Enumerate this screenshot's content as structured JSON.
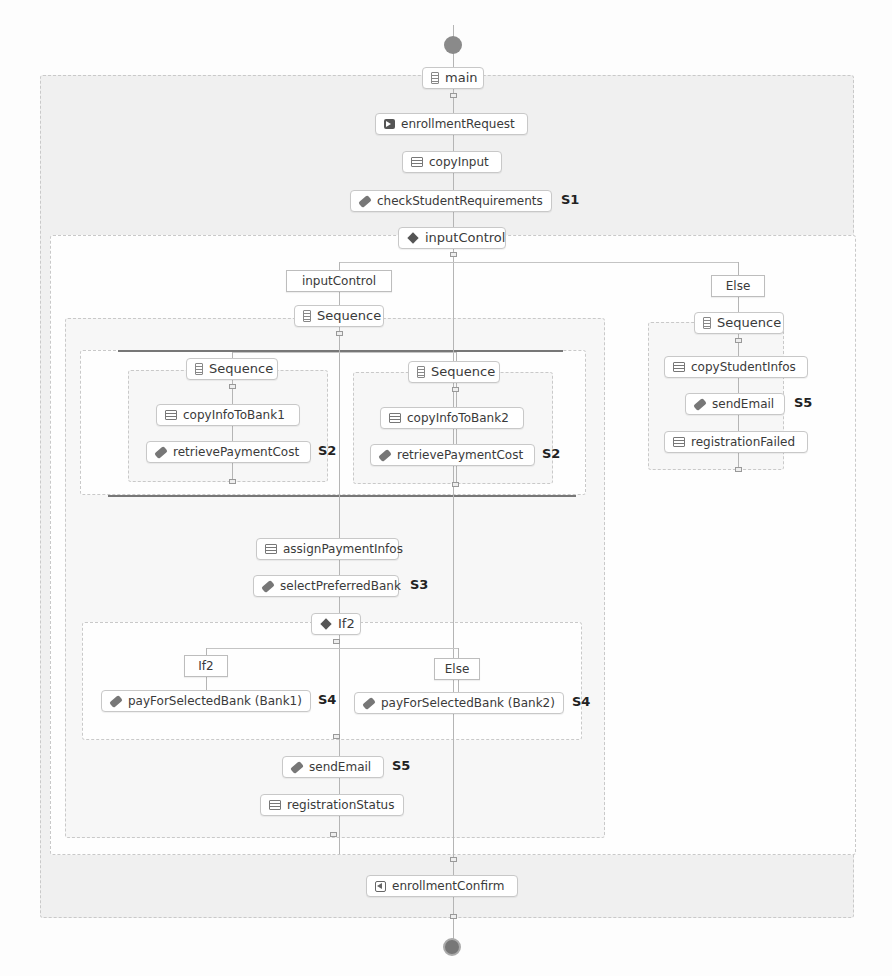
{
  "diagram": {
    "main": {
      "label": "main",
      "steps": {
        "enrollment_request": "enrollmentRequest",
        "copy_input": "copyInput",
        "check_student_requirements": "checkStudentRequirements",
        "check_tag": "S1",
        "input_control": "inputControl",
        "enrollment_confirm": "enrollmentConfirm"
      }
    },
    "input_control_branch": {
      "condition_label": "inputControl",
      "sequence_label": "Sequence",
      "flow": {
        "left": {
          "sequence_label": "Sequence",
          "copy": "copyInfoToBank1",
          "retrieve": "retrievePaymentCost",
          "tag": "S2"
        },
        "right": {
          "sequence_label": "Sequence",
          "copy": "copyInfoToBank2",
          "retrieve": "retrievePaymentCost",
          "tag": "S2"
        }
      },
      "assign_payment_infos": "assignPaymentInfos",
      "select_preferred_bank": "selectPreferredBank",
      "select_tag": "S3",
      "if2": {
        "label": "If2",
        "if_branch_label": "If2",
        "else_branch_label": "Else",
        "pay_bank1": "payForSelectedBank (Bank1)",
        "pay_bank2": "payForSelectedBank (Bank2)",
        "tag": "S4"
      },
      "send_email": "sendEmail",
      "send_email_tag": "S5",
      "registration_status": "registrationStatus"
    },
    "else_branch": {
      "condition_label": "Else",
      "sequence_label": "Sequence",
      "copy_student_infos": "copyStudentInfos",
      "send_email": "sendEmail",
      "send_email_tag": "S5",
      "registration_failed": "registrationFailed"
    }
  }
}
